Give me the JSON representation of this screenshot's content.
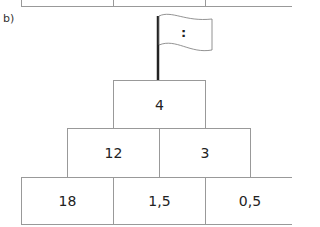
{
  "part_label": "b)",
  "flag": {
    "symbol": ":"
  },
  "pyramid": {
    "rows": [
      [
        "4"
      ],
      [
        "12",
        "3"
      ],
      [
        "18",
        "1,5",
        "0,5"
      ]
    ]
  }
}
